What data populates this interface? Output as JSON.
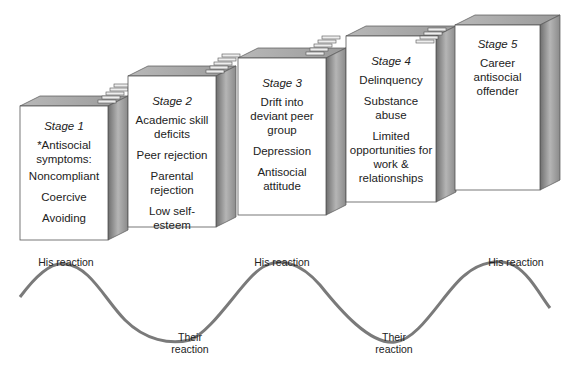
{
  "stages": [
    {
      "title": "Stage 1",
      "items": [
        "*Antisocial symptoms:",
        "Noncompliant",
        "Coercive",
        "Avoiding"
      ]
    },
    {
      "title": "Stage 2",
      "items": [
        "Academic skill deficits",
        "Peer rejection",
        "Parental rejection",
        "Low self-esteem"
      ]
    },
    {
      "title": "Stage 3",
      "items": [
        "Drift into deviant peer group",
        "Depression",
        "Antisocial attitude"
      ]
    },
    {
      "title": "Stage 4",
      "items": [
        "Delinquency",
        "Substance abuse",
        "Limited opportunities for work & relationships"
      ]
    },
    {
      "title": "Stage 5",
      "items": [
        "Career antisocial offender"
      ]
    }
  ],
  "wave": {
    "labels": [
      {
        "text": "His reaction",
        "position": "peak"
      },
      {
        "text": "Their reaction",
        "position": "trough"
      },
      {
        "text": "His reaction",
        "position": "peak"
      },
      {
        "text": "Their reaction",
        "position": "trough"
      },
      {
        "text": "His reaction",
        "position": "peak"
      }
    ]
  },
  "colors": {
    "front_face": "#ffffff",
    "top_face": "#a9a9a9",
    "side_face": "#8c8c8c",
    "outline": "#555555",
    "wave": "#7a7a7a"
  }
}
